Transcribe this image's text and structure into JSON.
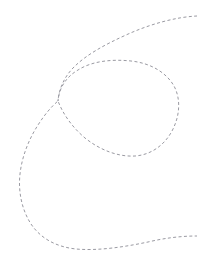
{
  "figure": {
    "kind": "dashed-curve-drawing",
    "title": "Dashed looping curve",
    "canvas": {
      "width": 197,
      "height": 267,
      "background_color": "#ffffff"
    },
    "stroke": {
      "color": "#9a9aa2",
      "width": 1,
      "dash_pattern": "3 2.4",
      "style": "dashed",
      "linecap": "butt"
    },
    "strokes": [
      {
        "name": "main-looping-curve",
        "description": "Single continuous dashed curve: enters at the right edge near the top, sweeps left and down into a self-crossing, forms a large rounded loop to the right, passes back through the crossing, sweeps down and left to the far-left bulge, then curves along the bottom and exits the right edge.",
        "closed": false,
        "d": "M 197 16 C 176 17 150 24 126 35 C 104 45 86 55 74 67 C 64 77 59 89 58 101 C 59 88 66 77 78 70 C 92 61 112 59 131 61 C 150 63 166 72 174 86 C 181 99 180 116 172 131 C 164 146 150 155 135 156 C 118 157 100 150 85 138 C 72 127 63 114 58 101 C 52 106 45 114 38 125 C 29 139 22 156 20 174 C 18 192 22 210 31 224 C 41 239 57 247 76 249 C 98 251 124 247 148 242 C 165 238 181 236 197 236",
        "crossing_point": {
          "x": 58,
          "y": 101
        },
        "extremes": {
          "loop_top_y": 60,
          "loop_right_x": 179,
          "loop_bottom_y": 157,
          "left_bulge_x": 19,
          "bottom_y": 249,
          "right_entry_y": 16,
          "right_exit_y": 236
        }
      }
    ]
  }
}
